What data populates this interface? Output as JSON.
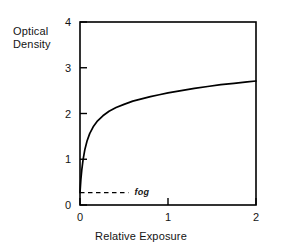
{
  "chart_data": {
    "type": "line",
    "title": "",
    "subtitle": "",
    "xlabel": "Relative Exposure",
    "ylabel": "Optical Density",
    "ylabel_line1": "Optical",
    "ylabel_line2": "Density",
    "xlim": [
      0,
      2
    ],
    "ylim": [
      0,
      4
    ],
    "xticks": [
      "0",
      "1",
      "2"
    ],
    "xtick_values": [
      0,
      1,
      2
    ],
    "yticks": [
      "0",
      "1",
      "2",
      "3",
      "4"
    ],
    "ytick_values": [
      0,
      1,
      2,
      3,
      4
    ],
    "grid": false,
    "legend": null,
    "series": [
      {
        "name": "characteristic curve",
        "style": "solid",
        "color": "#000000",
        "x": [
          0.0,
          0.01,
          0.02,
          0.035,
          0.055,
          0.08,
          0.11,
          0.15,
          0.2,
          0.26,
          0.33,
          0.41,
          0.5,
          0.6,
          0.7,
          0.8,
          0.9,
          1.0,
          1.15,
          1.3,
          1.45,
          1.6,
          1.75,
          1.9,
          2.0
        ],
        "y": [
          0.27,
          0.56,
          0.76,
          0.99,
          1.21,
          1.4,
          1.56,
          1.71,
          1.84,
          1.95,
          2.05,
          2.13,
          2.2,
          2.27,
          2.32,
          2.37,
          2.41,
          2.45,
          2.5,
          2.55,
          2.59,
          2.63,
          2.66,
          2.69,
          2.71
        ]
      }
    ],
    "annotations": [
      {
        "name": "fog-line",
        "label": "fog",
        "style": "dashed",
        "y_value": 0.27,
        "x_start": 0.0,
        "x_end": 0.55,
        "label_x": 0.62,
        "italic": true
      }
    ],
    "axis_color": "#000000",
    "curve_color": "#000000",
    "background": "#ffffff"
  }
}
